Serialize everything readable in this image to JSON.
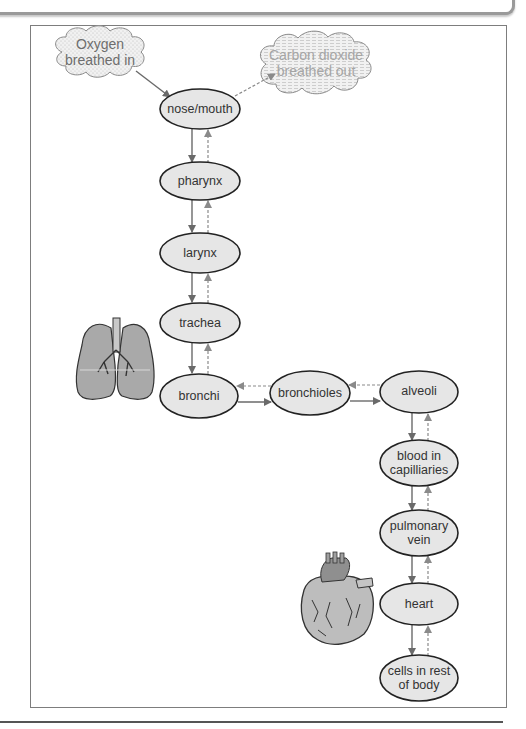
{
  "diagram": {
    "type": "flow",
    "title": "",
    "colors": {
      "node_fill": "#e6e6e6",
      "node_stroke": "#222222",
      "arrow": "#6a6a6a",
      "frame": "#7d7d7d"
    },
    "clouds": [
      {
        "id": "oxygen_in",
        "label_lines": [
          "Oxygen",
          "breathed in"
        ]
      },
      {
        "id": "co2_out",
        "label_lines": [
          "Carbon dioxide",
          "breathed out"
        ]
      }
    ],
    "nodes": [
      {
        "id": "nose_mouth",
        "label_lines": [
          "nose/mouth"
        ]
      },
      {
        "id": "pharynx",
        "label_lines": [
          "pharynx"
        ]
      },
      {
        "id": "larynx",
        "label_lines": [
          "larynx"
        ]
      },
      {
        "id": "trachea",
        "label_lines": [
          "trachea"
        ]
      },
      {
        "id": "bronchi",
        "label_lines": [
          "bronchi"
        ]
      },
      {
        "id": "bronchioles",
        "label_lines": [
          "bronchioles"
        ]
      },
      {
        "id": "alveoli",
        "label_lines": [
          "alveoli"
        ]
      },
      {
        "id": "blood_capillaries",
        "label_lines": [
          "blood in",
          "capilliaries"
        ]
      },
      {
        "id": "pulmonary_vein",
        "label_lines": [
          "pulmonary",
          "vein"
        ]
      },
      {
        "id": "heart",
        "label_lines": [
          "heart"
        ]
      },
      {
        "id": "cells_body",
        "label_lines": [
          "cells in rest",
          "of body"
        ]
      }
    ],
    "edges": [
      {
        "from": "oxygen_in",
        "to": "nose_mouth",
        "style": "solid"
      },
      {
        "from": "nose_mouth",
        "to": "co2_out",
        "style": "dashed"
      },
      {
        "from": "nose_mouth",
        "to": "pharynx",
        "style": "solid"
      },
      {
        "from": "pharynx",
        "to": "nose_mouth",
        "style": "dashed"
      },
      {
        "from": "pharynx",
        "to": "larynx",
        "style": "solid"
      },
      {
        "from": "larynx",
        "to": "pharynx",
        "style": "dashed"
      },
      {
        "from": "larynx",
        "to": "trachea",
        "style": "solid"
      },
      {
        "from": "trachea",
        "to": "larynx",
        "style": "dashed"
      },
      {
        "from": "trachea",
        "to": "bronchi",
        "style": "solid"
      },
      {
        "from": "bronchi",
        "to": "trachea",
        "style": "dashed"
      },
      {
        "from": "bronchi",
        "to": "bronchioles",
        "style": "solid"
      },
      {
        "from": "bronchioles",
        "to": "bronchi",
        "style": "dashed"
      },
      {
        "from": "bronchioles",
        "to": "alveoli",
        "style": "solid"
      },
      {
        "from": "alveoli",
        "to": "bronchioles",
        "style": "dashed"
      },
      {
        "from": "alveoli",
        "to": "blood_capillaries",
        "style": "solid"
      },
      {
        "from": "blood_capillaries",
        "to": "alveoli",
        "style": "dashed"
      },
      {
        "from": "blood_capillaries",
        "to": "pulmonary_vein",
        "style": "solid"
      },
      {
        "from": "pulmonary_vein",
        "to": "blood_capillaries",
        "style": "dashed"
      },
      {
        "from": "pulmonary_vein",
        "to": "heart",
        "style": "solid"
      },
      {
        "from": "heart",
        "to": "pulmonary_vein",
        "style": "dashed"
      },
      {
        "from": "heart",
        "to": "cells_body",
        "style": "solid"
      },
      {
        "from": "cells_body",
        "to": "heart",
        "style": "dashed"
      }
    ],
    "illustrations": [
      {
        "id": "lungs",
        "icon": "lungs-icon"
      },
      {
        "id": "heart_drawing",
        "icon": "heart-organ-icon"
      }
    ]
  }
}
